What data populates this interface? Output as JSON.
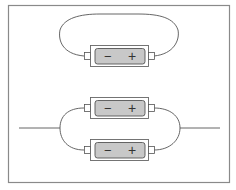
{
  "diagram": {
    "colors": {
      "frame": "#8a8a8a",
      "wire": "#555555",
      "battery_case": "#ffffff",
      "battery_case_stroke": "#666666",
      "battery_body": "#c8c8c8",
      "battery_body_stroke": "#555555",
      "terminal": "#ffffff",
      "symbol": "#333333"
    },
    "circuits": [
      {
        "name": "single-battery-loop",
        "batteries": [
          {
            "negative_label": "−",
            "positive_label": "+"
          }
        ]
      },
      {
        "name": "parallel-batteries",
        "batteries": [
          {
            "negative_label": "−",
            "positive_label": "+"
          },
          {
            "negative_label": "−",
            "positive_label": "+"
          }
        ]
      }
    ]
  }
}
